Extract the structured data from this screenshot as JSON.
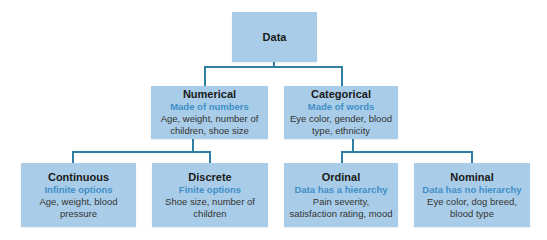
{
  "diagram": {
    "type": "tree",
    "colors": {
      "box_fill": "#a9cde8",
      "connector": "#2f7fa3",
      "title_text": "#1a1a1a",
      "subtitle_text": "#3f8fc9",
      "description_text": "#333333"
    },
    "root": {
      "title": "Data"
    },
    "level1": [
      {
        "title": "Numerical",
        "subtitle": "Made of numbers",
        "description": "Age, weight, number of children, shoe size"
      },
      {
        "title": "Categorical",
        "subtitle": "Made of words",
        "description": "Eye color, gender, blood type, ethnicity"
      }
    ],
    "level2": [
      {
        "parent": "Numerical",
        "title": "Continuous",
        "subtitle": "Infinite options",
        "description": "Age, weight, blood pressure"
      },
      {
        "parent": "Numerical",
        "title": "Discrete",
        "subtitle": "Finite options",
        "description": "Shoe size, number of children"
      },
      {
        "parent": "Categorical",
        "title": "Ordinal",
        "subtitle": "Data has a hierarchy",
        "description": "Pain severity, satisfaction rating, mood"
      },
      {
        "parent": "Categorical",
        "title": "Nominal",
        "subtitle": "Data has no hierarchy",
        "description": "Eye color, dog breed, blood type"
      }
    ]
  }
}
